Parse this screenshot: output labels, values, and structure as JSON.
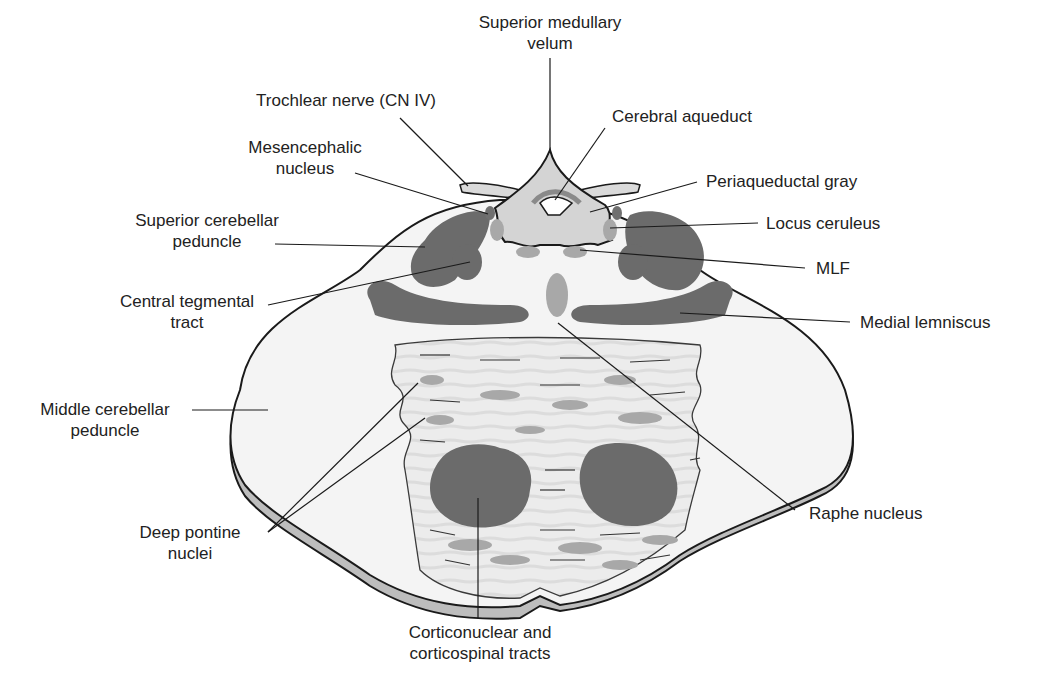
{
  "figure": {
    "colors": {
      "background": "#ffffff",
      "tissue_fill": "#f3f3f3",
      "basis_fill": "#e8e8e8",
      "dark_tract": "#6b6b6b",
      "light_nucleus": "#a8a8a8",
      "periaqueductal": "#d4d4d4",
      "outline": "#1a1a1a",
      "rim": "#bdbdbd"
    }
  },
  "labels": {
    "superior_medullary_velum": "Superior medullary\nvelum",
    "trochlear_nerve": "Trochlear nerve (CN IV)",
    "cerebral_aqueduct": "Cerebral aqueduct",
    "mesencephalic_nucleus": "Mesencephalic\nnucleus",
    "periaqueductal_gray": "Periaqueductal gray",
    "superior_cerebellar_peduncle": "Superior cerebellar\npeduncle",
    "locus_ceruleus": "Locus ceruleus",
    "mlf": "MLF",
    "central_tegmental_tract": "Central tegmental\ntract",
    "medial_lemniscus": "Medial lemniscus",
    "middle_cerebellar_peduncle": "Middle cerebellar\npeduncle",
    "raphe_nucleus": "Raphe nucleus",
    "deep_pontine_nuclei": "Deep pontine\nnuclei",
    "corticonuclear_corticospinal": "Corticonuclear and\ncorticospinal tracts"
  }
}
